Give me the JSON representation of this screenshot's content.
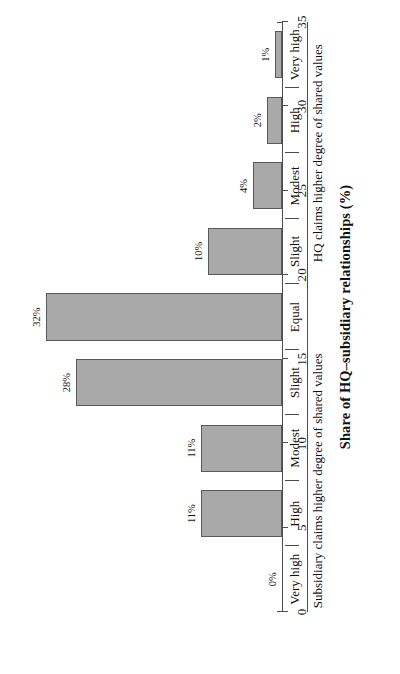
{
  "chart_data": {
    "type": "bar",
    "orientation": "vertical-rendered-rotated",
    "title": "",
    "xlabel": "",
    "ylabel": "Share of HQ–subsidiary relationships (%)",
    "ylim": [
      0,
      35
    ],
    "ytick_values": [
      0,
      5,
      10,
      15,
      20,
      25,
      30,
      35
    ],
    "ytick_labels": [
      "0",
      "5",
      "10",
      "15",
      "20",
      "25",
      "30",
      "35"
    ],
    "grid": false,
    "legend": false,
    "bar_color": "#a9a9a9",
    "bar_border_color": "#5a5a5a",
    "axis_color": "#4d4d4d",
    "categories": [
      "Very high",
      "High",
      "Modest",
      "Slight",
      "Equal",
      "Slight",
      "Modest",
      "High",
      "Very high"
    ],
    "values": [
      0,
      11,
      11,
      28,
      32,
      10,
      4,
      2,
      1
    ],
    "data_labels": [
      "0%",
      "11%",
      "11%",
      "28%",
      "32%",
      "10%",
      "4%",
      "2%",
      "1%"
    ],
    "groups": [
      {
        "label": "Subsidiary claims higher degree of shared values",
        "start_index": 0,
        "end_index": 3
      },
      {
        "label": "",
        "start_index": 4,
        "end_index": 4
      },
      {
        "label": "HQ claims higher degree of shared values",
        "start_index": 5,
        "end_index": 8
      }
    ],
    "separators_after_index": [
      0,
      1,
      2,
      3,
      4,
      5,
      6,
      7
    ]
  }
}
